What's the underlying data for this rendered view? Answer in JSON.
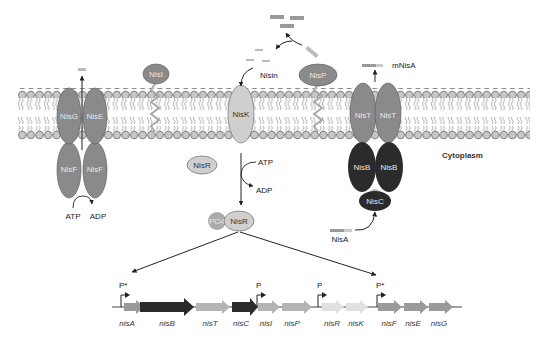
{
  "figure": {
    "compartment_label": "Cytoplasm",
    "colors": {
      "protein_mid": "#8a8a8a",
      "protein_light": "#cfcfcf",
      "protein_dark": "#2b2b2b",
      "lipid_head": "#c8c8c8",
      "line": "#222222"
    }
  },
  "proteins": {
    "nisG": "NisG",
    "nisE": "NisE",
    "nisF1": "NisF",
    "nisF2": "NisF",
    "nisI": "NisI",
    "nisK": "NisK",
    "nisP": "NisP",
    "nisT1": "NisT",
    "nisT2": "NisT",
    "nisB1": "NisB",
    "nisB2": "NisB",
    "nisC": "NisC",
    "nisR": "NisR",
    "nisR_p": "NisR",
    "po4": "PO4"
  },
  "labels": {
    "nisin": "Nisin",
    "mNisA": "mNisA",
    "nisA_peptide": "NisA",
    "atp_left": "ATP",
    "adp_left": "ADP",
    "atp_r": "ATP",
    "adp_r": "ADP"
  },
  "operon": {
    "genes": [
      {
        "name": "nisA",
        "shade": "mid"
      },
      {
        "name": "nisB",
        "shade": "dark"
      },
      {
        "name": "nisT",
        "shade": "mid"
      },
      {
        "name": "nisC",
        "shade": "dark"
      },
      {
        "name": "nisI",
        "shade": "mid"
      },
      {
        "name": "nisP",
        "shade": "mid"
      },
      {
        "name": "nisR",
        "shade": "light"
      },
      {
        "name": "nisK",
        "shade": "light"
      },
      {
        "name": "nisF",
        "shade": "mid"
      },
      {
        "name": "nisE",
        "shade": "mid"
      },
      {
        "name": "nisG",
        "shade": "mid"
      }
    ],
    "promoters": [
      "P*",
      "P",
      "P",
      "P*"
    ]
  }
}
